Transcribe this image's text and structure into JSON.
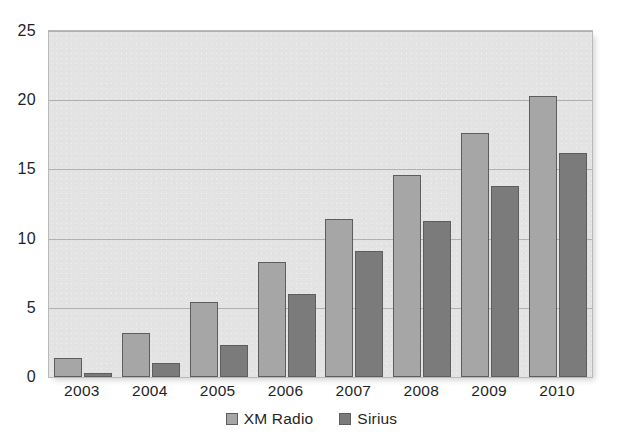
{
  "chart_data": {
    "type": "bar",
    "title": "",
    "subtitle": "",
    "xlabel": "",
    "ylabel": "",
    "categories": [
      "2003",
      "2004",
      "2005",
      "2006",
      "2007",
      "2008",
      "2009",
      "2010"
    ],
    "series": [
      {
        "name": "XM Radio",
        "color": "#a6a6a6",
        "values": [
          1.4,
          3.2,
          5.4,
          8.3,
          11.4,
          14.6,
          17.6,
          20.3
        ]
      },
      {
        "name": "Sirius",
        "color": "#7b7b7b",
        "values": [
          0.3,
          1.0,
          2.3,
          6.0,
          9.1,
          11.3,
          13.8,
          16.2
        ]
      }
    ],
    "ylim": [
      0,
      25
    ],
    "yticks": [
      0,
      5,
      10,
      15,
      20,
      25
    ],
    "ytick_labels": [
      "0",
      "5",
      "10",
      "15",
      "20",
      "25"
    ],
    "grid": true,
    "grid_axis": "y",
    "legend": true,
    "legend_position": "bottom-center",
    "plot_background": "#e3e3e3",
    "plot_border_color": "#b9b9b9",
    "figure_background": "#ffffff",
    "bar_edge_color": "#5d5d5d",
    "annotations": []
  }
}
